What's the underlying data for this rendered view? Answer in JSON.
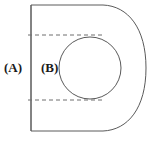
{
  "figure": {
    "background_color": "#ffffff",
    "stroke_color": "#5a5a5a",
    "dash_color": "#6e6e6e",
    "label_color": "#1a1a1a",
    "labels": [
      {
        "id": "a",
        "text": "(A)",
        "x": 4,
        "y": 61
      },
      {
        "id": "b",
        "text": "(B)",
        "x": 41,
        "y": 61
      }
    ],
    "outline": {
      "name": "d-shape-outline",
      "left_edge_x": 31,
      "top_edge_y": 5,
      "bottom_edge_y": 131,
      "straight_run_end_x": 103,
      "right_extent_x": 146,
      "description": "Vertical left edge with horizontal top and bottom edges closed by a large right-hand bulge"
    },
    "inner_circle": {
      "name": "inner-circle",
      "cx": 90,
      "cy": 68,
      "r": 31
    },
    "dashed_lines": [
      {
        "name": "upper-dashed-line",
        "y": 35,
        "x1": 29,
        "x2": 103
      },
      {
        "name": "lower-dashed-line",
        "y": 100,
        "x1": 29,
        "x2": 103
      }
    ]
  }
}
